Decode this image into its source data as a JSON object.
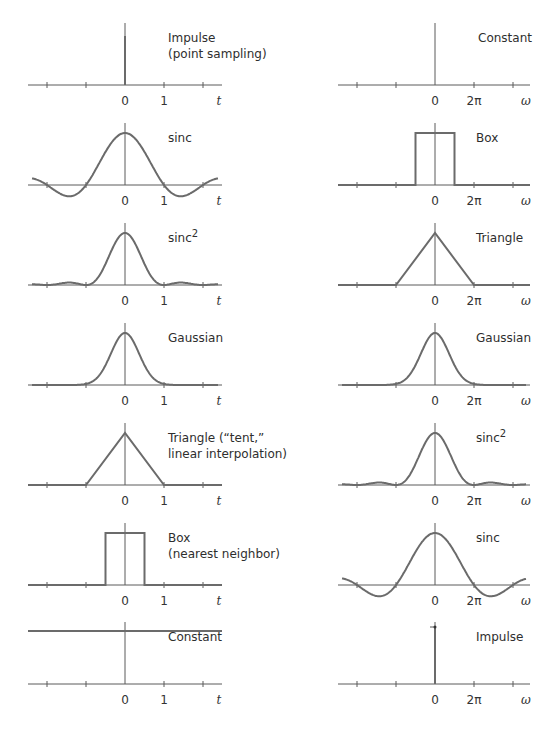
{
  "chart_data": {
    "type": "line",
    "layout": {
      "columns": 2,
      "rows": 7,
      "grid": false,
      "legend": "none"
    },
    "left_column": {
      "xlabel": "t",
      "tick_labels": [
        "0",
        "1"
      ],
      "panels": [
        {
          "name": "Impulse",
          "subtitle": "(point sampling)",
          "kind": "impulse"
        },
        {
          "name": "sinc",
          "subtitle": "",
          "kind": "sinc"
        },
        {
          "name": "sinc",
          "superscript": "2",
          "subtitle": "",
          "kind": "sinc2"
        },
        {
          "name": "Gaussian",
          "subtitle": "",
          "kind": "gaussian"
        },
        {
          "name": "Triangle (“tent,”",
          "subtitle": "linear interpolation)",
          "kind": "triangle"
        },
        {
          "name": "Box",
          "subtitle": "(nearest neighbor)",
          "kind": "box"
        },
        {
          "name": "Constant",
          "subtitle": "",
          "kind": "constant"
        }
      ]
    },
    "right_column": {
      "xlabel": "ω",
      "tick_labels": [
        "0",
        "2π"
      ],
      "panels": [
        {
          "name": "Constant",
          "kind": "constant_on_axis"
        },
        {
          "name": "Box",
          "kind": "box"
        },
        {
          "name": "Triangle",
          "kind": "triangle"
        },
        {
          "name": "Gaussian",
          "kind": "gaussian"
        },
        {
          "name": "sinc",
          "superscript": "2",
          "kind": "sinc2"
        },
        {
          "name": "sinc",
          "kind": "sinc"
        },
        {
          "name": "Impulse",
          "kind": "impulse"
        }
      ]
    },
    "pairs": [
      [
        "Impulse",
        "Constant"
      ],
      [
        "sinc",
        "Box"
      ],
      [
        "sinc²",
        "Triangle"
      ],
      [
        "Gaussian",
        "Gaussian"
      ],
      [
        "Triangle",
        "sinc²"
      ],
      [
        "Box",
        "sinc"
      ],
      [
        "Constant",
        "Impulse"
      ]
    ]
  },
  "colors": {
    "curve": "#6b6b6b",
    "axis": "#5a5a5a",
    "text": "#333333"
  }
}
